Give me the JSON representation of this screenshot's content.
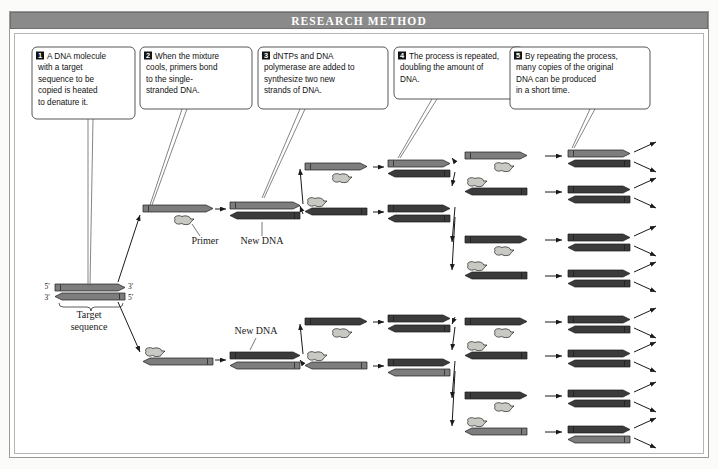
{
  "figure": {
    "header_title": "RESEARCH METHOD",
    "background": "#ffffff",
    "frame_border": "#9a9a9a",
    "header_bg": "#8a8a8a",
    "header_fg": "#ffffff"
  },
  "colors": {
    "strand_gray": "#7d7d7d",
    "strand_dark": "#3b3b3b",
    "primer_light": "#c9c9c4",
    "outline": "#1a1a1a",
    "arrow_line": "#1a1a1a",
    "callout_border": "#444444"
  },
  "callouts": [
    {
      "number": "1",
      "lines": [
        "A DNA molecule",
        "with a target",
        "sequence to be",
        "copied is heated",
        "to denature it."
      ],
      "x": 32,
      "y": 47,
      "w": 103,
      "h": 72
    },
    {
      "number": "2",
      "lines": [
        "When the mixture",
        "cools, primers bond",
        "to the single-",
        "stranded DNA."
      ],
      "x": 140,
      "y": 47,
      "w": 112,
      "h": 62
    },
    {
      "number": "3",
      "lines": [
        "dNTPs and DNA",
        "polymerase are added to",
        "synthesize two new",
        "strands of DNA."
      ],
      "x": 258,
      "y": 47,
      "w": 130,
      "h": 62
    },
    {
      "number": "4",
      "lines": [
        "The process is repeated,",
        "doubling the amount of",
        "DNA."
      ],
      "x": 394,
      "y": 47,
      "w": 130,
      "h": 52
    },
    {
      "number": "5",
      "lines": [
        "By repeating the process,",
        "many copies of the original",
        "DNA can be produced",
        "in a short time."
      ],
      "x": 510,
      "y": 47,
      "w": 140,
      "h": 62
    }
  ],
  "labels": [
    {
      "text": "Primer",
      "x": 205,
      "y": 244,
      "anchor": "middle"
    },
    {
      "text": "New DNA",
      "x": 262,
      "y": 244,
      "anchor": "middle"
    },
    {
      "text": "New DNA",
      "x": 256,
      "y": 334,
      "anchor": "middle"
    },
    {
      "text": "Target",
      "x": 89,
      "y": 318,
      "anchor": "middle"
    },
    {
      "text": "sequence",
      "x": 89,
      "y": 330,
      "anchor": "middle"
    }
  ],
  "tick_labels": [
    {
      "text": "5′",
      "x": 50,
      "y": 289,
      "anchor": "end"
    },
    {
      "text": "3′",
      "x": 128,
      "y": 289,
      "anchor": "start"
    },
    {
      "text": "3′",
      "x": 50,
      "y": 300,
      "anchor": "end"
    },
    {
      "text": "5′",
      "x": 128,
      "y": 300,
      "anchor": "start"
    }
  ],
  "diagram": {
    "original_duplex": {
      "x": 55,
      "y": 284,
      "width": 70,
      "top_strand": {
        "direction": "right",
        "color": "#7d7d7d"
      },
      "bottom_strand": {
        "direction": "left",
        "color": "#7d7d7d"
      }
    },
    "stage_columns": [
      {
        "stage": 2,
        "label": "primer binding",
        "count": 2,
        "x": 143
      },
      {
        "stage": 3,
        "label": "new strand synthesis",
        "count": 2,
        "x": 228
      },
      {
        "stage": 4,
        "label": "denature + prime",
        "count": 4,
        "x": 305
      },
      {
        "stage": 4,
        "label": "extend",
        "count": 4,
        "x": 388
      },
      {
        "stage": 5,
        "label": "denature + prime",
        "count": 8,
        "x": 465
      },
      {
        "stage": 5,
        "label": "extend",
        "count": 8,
        "x": 568
      }
    ],
    "col_c_rows_y": [
      170,
      210,
      260,
      300,
      345,
      385,
      420,
      455
    ],
    "doubling_sequence": [
      1,
      2,
      4,
      8,
      16
    ]
  }
}
